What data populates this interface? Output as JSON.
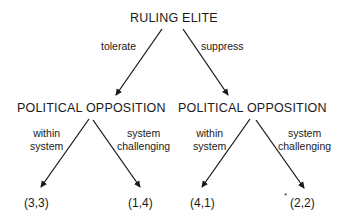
{
  "diagram": {
    "type": "game-tree",
    "root": {
      "label": "RULING ELITE"
    },
    "first_moves": [
      {
        "label": "tolerate"
      },
      {
        "label": "suppress"
      }
    ],
    "second_level": [
      {
        "label": "POLITICAL OPPOSITION",
        "moves": [
          {
            "label_line1": "within",
            "label_line2": "system",
            "payoff": "(3,3)",
            "marked": false
          },
          {
            "label_line1": "system",
            "label_line2": "challenging",
            "payoff": "(1,4)",
            "marked": false
          }
        ]
      },
      {
        "label": "POLITICAL OPPOSITION",
        "moves": [
          {
            "label_line1": "within",
            "label_line2": "system",
            "payoff": "(4,1)",
            "marked": false
          },
          {
            "label_line1": "system",
            "label_line2": "challenging",
            "payoff": "(2,2)",
            "marked": true,
            "marker": "*"
          }
        ]
      }
    ],
    "colors": {
      "ink": "#1a1a1a",
      "background": "#ffffff"
    }
  }
}
